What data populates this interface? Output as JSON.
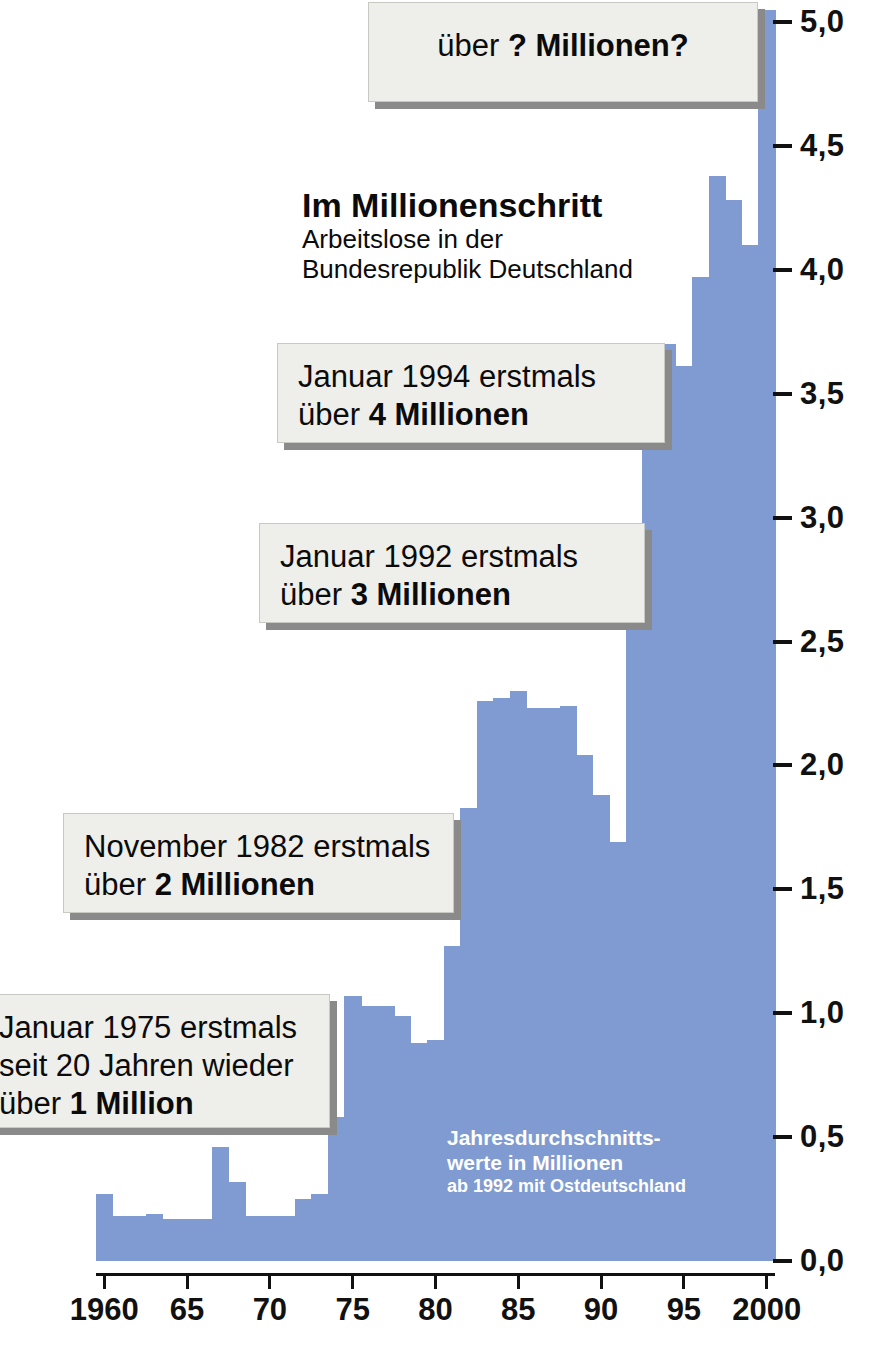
{
  "headline": {
    "title": "Im Millionenschritt",
    "subtitle_line1": "Arbeitslose in der",
    "subtitle_line2": "Bundesrepublik Deutschland"
  },
  "footnote": {
    "line1": "Jahresdurchschnitts-",
    "line2": "werte in Millionen",
    "line3": "ab 1992 mit Ostdeutschland"
  },
  "callouts": [
    {
      "id": "callout-question",
      "line1_normal": "über ",
      "line1_bold": "? Millionen?"
    },
    {
      "id": "callout-1994",
      "line1": "Januar 1994 erstmals",
      "line2_normal": "über ",
      "line2_bold": "4 Millionen"
    },
    {
      "id": "callout-1992",
      "line1": "Januar 1992 erstmals",
      "line2_normal": "über ",
      "line2_bold": "3 Millionen"
    },
    {
      "id": "callout-1982",
      "line1": "November 1982 erstmals",
      "line2_normal": "über ",
      "line2_bold": "2 Millionen"
    },
    {
      "id": "callout-1975",
      "line1": "Januar 1975 erstmals",
      "line2": "seit 20 Jahren wieder",
      "line3_normal": "über ",
      "line3_bold": "1 Million"
    }
  ],
  "colors": {
    "bar_fill": "#7f9bd1",
    "axis": "#111111",
    "box_face": "#eeeeea",
    "box_shadow": "#8a8a8a",
    "background": "#ffffff",
    "footnote_text": "#ffffff"
  },
  "chart_data": {
    "type": "bar",
    "title": "Im Millionenschritt",
    "subtitle": "Arbeitslose in der Bundesrepublik Deutschland",
    "xlabel": "",
    "ylabel": "Millionen",
    "note": "Jahresdurchschnittswerte in Millionen, ab 1992 mit Ostdeutschland",
    "xlim": [
      1959.5,
      2000.5
    ],
    "ylim": [
      0.0,
      5.0
    ],
    "grid": false,
    "legend": "none",
    "ytick_labels": [
      "0,0",
      "0,5",
      "1,0",
      "1,5",
      "2,0",
      "2,5",
      "3,0",
      "3,5",
      "4,0",
      "4,5",
      "5,0"
    ],
    "ytick_values": [
      0.0,
      0.5,
      1.0,
      1.5,
      2.0,
      2.5,
      3.0,
      3.5,
      4.0,
      4.5,
      5.0
    ],
    "xtick_labels": [
      "1960",
      "65",
      "70",
      "75",
      "80",
      "85",
      "90",
      "95",
      "2000"
    ],
    "xtick_values": [
      1960,
      1965,
      1970,
      1975,
      1980,
      1985,
      1990,
      1995,
      2000
    ],
    "categories": [
      1960,
      1961,
      1962,
      1963,
      1964,
      1965,
      1966,
      1967,
      1968,
      1969,
      1970,
      1971,
      1972,
      1973,
      1974,
      1975,
      1976,
      1977,
      1978,
      1979,
      1980,
      1981,
      1982,
      1983,
      1984,
      1985,
      1986,
      1987,
      1988,
      1989,
      1990,
      1991,
      1992,
      1993,
      1994,
      1995,
      1996,
      1997,
      1998,
      1999,
      2000
    ],
    "values": [
      0.27,
      0.18,
      0.18,
      0.19,
      0.17,
      0.17,
      0.17,
      0.46,
      0.32,
      0.18,
      0.18,
      0.18,
      0.25,
      0.27,
      0.58,
      1.07,
      1.03,
      1.03,
      0.99,
      0.88,
      0.89,
      1.27,
      1.83,
      2.26,
      2.27,
      2.3,
      2.23,
      2.23,
      2.24,
      2.04,
      1.88,
      1.69,
      2.98,
      3.42,
      3.7,
      3.61,
      3.97,
      4.38,
      4.28,
      4.1,
      5.05
    ]
  }
}
